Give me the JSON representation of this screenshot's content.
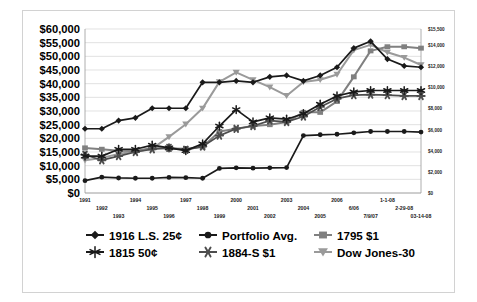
{
  "chart_data": {
    "type": "line",
    "title": "",
    "xlabel": "",
    "ylabel": "",
    "grid": true,
    "legend_position": "bottom",
    "x": [
      "1991",
      "1992",
      "1993",
      "1994",
      "1995",
      "1996",
      "1997",
      "1998",
      "1999",
      "2000",
      "2001",
      "2002",
      "2003",
      "2004",
      "2005",
      "2006",
      "6/06",
      "7/9/07",
      "1-1-08",
      "2-29-08",
      "03-14-08"
    ],
    "xtick_labels_row1": [
      "1991",
      "1994",
      "1997",
      "2000",
      "2003",
      "2006",
      "1-1-08"
    ],
    "xtick_labels_row2": [
      "1992",
      "1995",
      "1998",
      "2001",
      "2004",
      "6/06",
      "2-29-08"
    ],
    "xtick_labels_row3": [
      "1993",
      "1996",
      "1999",
      "2002",
      "2005",
      "7/9/07",
      "03-14-08"
    ],
    "ylim": [
      0,
      60000
    ],
    "ytick_labels": [
      "$60,000",
      "$55,000",
      "$50,000",
      "$45,000",
      "$40,000",
      "$35,000",
      "$30,000",
      "$25,000",
      "$20,000",
      "$15,000",
      "$10,000",
      "$5,000",
      "$0"
    ],
    "ytick_values": [
      60000,
      55000,
      50000,
      45000,
      40000,
      35000,
      30000,
      25000,
      20000,
      15000,
      10000,
      5000,
      0
    ],
    "y2lim": [
      0,
      15500
    ],
    "y2tick_labels": [
      "$15,500",
      "$14,000",
      "$12,000",
      "$10,000",
      "$8,000",
      "$6,000",
      "$4,000",
      "$2,000",
      "$0"
    ],
    "y2tick_values": [
      15500,
      14000,
      12000,
      10000,
      8000,
      6000,
      4000,
      2000,
      0
    ],
    "series": [
      {
        "name": "1916 L.S. 25¢",
        "marker": "diamond",
        "color": "#1a1a1a",
        "axis": "left",
        "values": [
          23500,
          23500,
          26500,
          27500,
          31000,
          31000,
          31000,
          40500,
          40500,
          41000,
          40500,
          42500,
          43000,
          41000,
          43000,
          46000,
          53000,
          55500,
          49000,
          46500,
          46000
        ]
      },
      {
        "name": "Portfolio Avg.",
        "marker": "circle",
        "color": "#1a1a1a",
        "axis": "left",
        "values": [
          4500,
          5800,
          5500,
          5400,
          5400,
          5700,
          5600,
          5400,
          9000,
          9200,
          9100,
          9200,
          9300,
          21000,
          21300,
          21500,
          22000,
          22500,
          22500,
          22500,
          22300
        ]
      },
      {
        "name": "1795 $1",
        "marker": "square",
        "color": "#808080",
        "axis": "left",
        "values": [
          16500,
          16000,
          15500,
          15400,
          16500,
          16300,
          16200,
          16800,
          22500,
          23500,
          24500,
          25000,
          26000,
          29500,
          29500,
          33500,
          42500,
          52000,
          53500,
          53500,
          53000
        ]
      },
      {
        "name": "1815 50¢",
        "marker": "star",
        "color": "#1a1a1a",
        "axis": "left",
        "values": [
          13500,
          13500,
          16000,
          16000,
          17500,
          16500,
          15500,
          18000,
          24500,
          30500,
          26000,
          27500,
          27000,
          29000,
          32500,
          35500,
          37000,
          37500,
          37500,
          37500,
          37500
        ]
      },
      {
        "name": "1884-S $1",
        "marker": "burst",
        "color": "#4d4d4d",
        "axis": "left",
        "values": [
          14000,
          12000,
          13500,
          15000,
          16000,
          16500,
          15800,
          17000,
          21000,
          23500,
          24500,
          26500,
          26000,
          28000,
          31500,
          34500,
          35800,
          36000,
          35800,
          35500,
          35500
        ]
      },
      {
        "name": "Dow Jones-30",
        "marker": "triangle-down",
        "color": "#9a9a9a",
        "axis": "right",
        "values": [
          3100,
          3300,
          3700,
          3900,
          4200,
          5300,
          6500,
          8000,
          10500,
          11400,
          10700,
          10000,
          9200,
          10500,
          10700,
          11200,
          13500,
          14000,
          13300,
          12800,
          12100
        ]
      }
    ],
    "legend": [
      {
        "label": "1916 L.S. 25¢",
        "marker": "diamond",
        "color": "#1a1a1a"
      },
      {
        "label": "Portfolio Avg.",
        "marker": "circle",
        "color": "#1a1a1a"
      },
      {
        "label": "1795 $1",
        "marker": "square",
        "color": "#808080"
      },
      {
        "label": "1815 50¢",
        "marker": "star",
        "color": "#1a1a1a"
      },
      {
        "label": "1884-S $1",
        "marker": "burst",
        "color": "#4d4d4d"
      },
      {
        "label": "Dow Jones-30",
        "marker": "triangle-down",
        "color": "#9a9a9a"
      }
    ]
  }
}
